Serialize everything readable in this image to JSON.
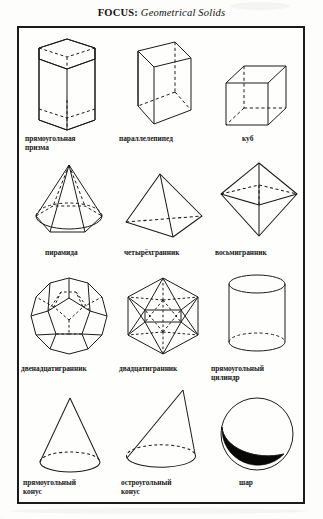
{
  "header": {
    "focus_label": "FOCUS:",
    "topic": "Geometrical Solids"
  },
  "figure": {
    "columns": 3,
    "rows": 4,
    "ink_color": "#1b1b1b",
    "hidden_edge_style": "dashed",
    "items": [
      {
        "id": "rectangular-prism",
        "label": "прямоугольная\nпризма",
        "shape": "hexagonal-prism"
      },
      {
        "id": "parallelepiped",
        "label": "параллелепипед",
        "shape": "parallelepiped"
      },
      {
        "id": "cube",
        "label": "куб",
        "shape": "cube"
      },
      {
        "id": "pyramid",
        "label": "пирамида",
        "shape": "hexagonal-pyramid"
      },
      {
        "id": "tetrahedron",
        "label": "четырёхгранник",
        "shape": "tetrahedron"
      },
      {
        "id": "octahedron",
        "label": "восьмигранник",
        "shape": "octahedron"
      },
      {
        "id": "dodecahedron",
        "label": "двенадцатигранник",
        "shape": "dodecahedron"
      },
      {
        "id": "icosahedron",
        "label": "двадцатигранник",
        "shape": "icosahedron"
      },
      {
        "id": "cylinder",
        "label": "прямоугольный\nцилиндр",
        "shape": "cylinder"
      },
      {
        "id": "right-cone",
        "label": "прямоугольный\nконус",
        "shape": "cone-right"
      },
      {
        "id": "acute-cone",
        "label": "остроугольный\nконус",
        "shape": "cone-acute"
      },
      {
        "id": "sphere",
        "label": "шар",
        "shape": "sphere"
      }
    ]
  }
}
